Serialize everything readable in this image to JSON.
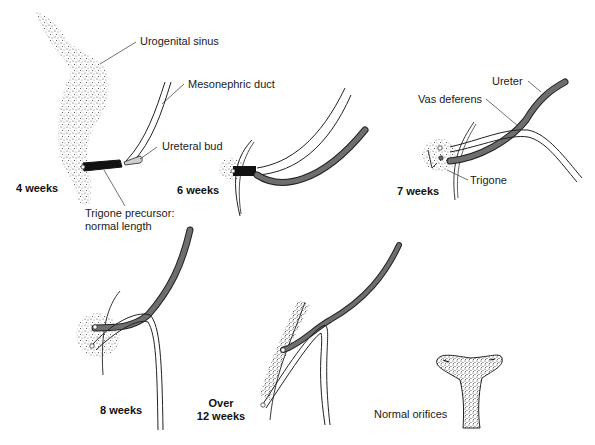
{
  "figure": {
    "stages": [
      {
        "id": "4w",
        "label": "4 weeks"
      },
      {
        "id": "6w",
        "label": "6 weeks"
      },
      {
        "id": "7w",
        "label": "7 weeks"
      },
      {
        "id": "8w",
        "label": "8 weeks"
      },
      {
        "id": "12w",
        "label_line1": "Over",
        "label_line2": "12 weeks"
      }
    ],
    "labels": {
      "urogenital_sinus": "Urogenital sinus",
      "mesonephric_duct": "Mesonephric duct",
      "ureteral_bud": "Ureteral bud",
      "trigone_precursor_line1": "Trigone precursor:",
      "trigone_precursor_line2": "normal length",
      "ureter": "Ureter",
      "vas_deferens": "Vas deferens",
      "trigone": "Trigone",
      "normal_orifices": "Normal orifices"
    },
    "colors": {
      "ureter_fill": "#6e6e6e",
      "trigone_precursor": "#111111",
      "duct_fill": "#ffffff",
      "stipple": "#555555",
      "text": "#1a1a1a"
    }
  }
}
